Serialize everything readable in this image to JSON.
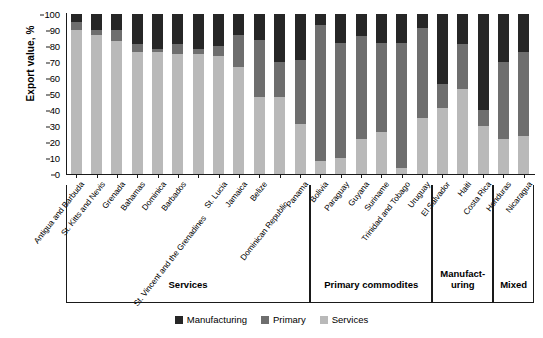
{
  "chart_data": {
    "type": "bar",
    "subtype": "stacked-bar-100",
    "title": "",
    "xlabel": "",
    "ylabel": "Export value, %",
    "ylim": [
      0,
      100
    ],
    "yticks": [
      0,
      10,
      20,
      30,
      40,
      50,
      60,
      70,
      80,
      90,
      100
    ],
    "ytick_labels": [
      "0",
      "10",
      "20",
      "30",
      "40",
      "50",
      "60",
      "70",
      "80",
      "90",
      "100"
    ],
    "grid": false,
    "legend_position": "bottom-center",
    "stack_order_bottom_to_top": [
      "Services",
      "Primary",
      "Manufacturing"
    ],
    "categories": [
      "Antigua and Barbuda",
      "St. Kitts and Nevis",
      "Grenada",
      "Bahamas",
      "Dominica",
      "Barbados",
      "St. Vincent and the Grenadines",
      "St. Lucia",
      "Jamaica",
      "Belize",
      "Dominican Republic",
      "Panama",
      "Bolivia",
      "Paraguay",
      "Guyana",
      "Suriname",
      "Trinidad and Tobago",
      "Uruguay",
      "El Salvador",
      "Haiti",
      "Costa Rica",
      "Honduras",
      "Nicaragua"
    ],
    "series": [
      {
        "name": "Services",
        "color": "#b9b9b9",
        "values": [
          90,
          87,
          83,
          76,
          76,
          75,
          75,
          74,
          67,
          48,
          48,
          31,
          8,
          10,
          22,
          26,
          4,
          35,
          41,
          53,
          30,
          22,
          24
        ]
      },
      {
        "name": "Primary",
        "color": "#6e6e6e",
        "values": [
          5,
          3,
          7,
          5,
          2,
          6,
          3,
          6,
          20,
          36,
          22,
          40,
          85,
          72,
          64,
          56,
          78,
          56,
          15,
          28,
          10,
          48,
          52
        ]
      },
      {
        "name": "Manufacturing",
        "color": "#262626",
        "values": [
          5,
          10,
          10,
          19,
          22,
          19,
          22,
          20,
          13,
          16,
          30,
          29,
          7,
          18,
          14,
          18,
          18,
          9,
          44,
          19,
          60,
          30,
          24
        ]
      }
    ],
    "groups": [
      {
        "label": "Services",
        "start_index": 0,
        "end_index": 11
      },
      {
        "label": "Primary commodites",
        "start_index": 12,
        "end_index": 17
      },
      {
        "label": "Manufact-\nuring",
        "label_line1": "Manufact-",
        "label_line2": "uring",
        "start_index": 18,
        "end_index": 20
      },
      {
        "label": "Mixed",
        "start_index": 21,
        "end_index": 22
      }
    ],
    "legend": [
      {
        "label": "Manufacturing",
        "color": "#262626"
      },
      {
        "label": "Primary",
        "color": "#6e6e6e"
      },
      {
        "label": "Services",
        "color": "#b9b9b9"
      }
    ]
  }
}
